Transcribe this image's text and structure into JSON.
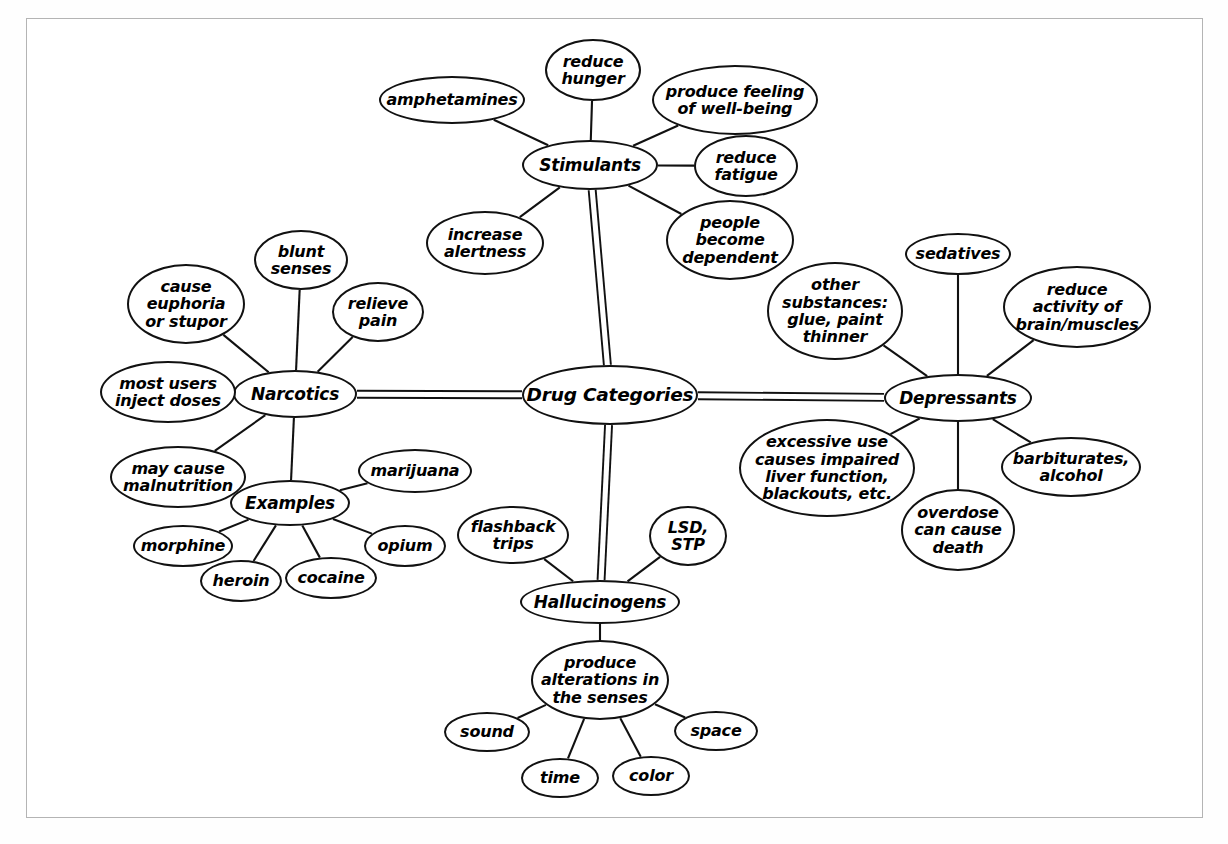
{
  "diagram": {
    "title": "Drug Categories",
    "type": "mind-map",
    "frame": {
      "stroke": "#b4b4b4",
      "background": "#ffffff"
    },
    "style": {
      "node_stroke": "#111111",
      "node_fill": "#ffffff",
      "text_color": "#000000",
      "edge_stroke": "#111111"
    },
    "nodes": [
      {
        "id": "drug-categories",
        "label": "Drug Categories",
        "kind": "center",
        "x": 610,
        "y": 395,
        "w": 176,
        "h": 60
      },
      {
        "id": "stimulants",
        "label": "Stimulants",
        "kind": "branch",
        "x": 590,
        "y": 165,
        "w": 136,
        "h": 50
      },
      {
        "id": "amphetamines",
        "label": "amphetamines",
        "kind": "leaf",
        "x": 452,
        "y": 100,
        "w": 146,
        "h": 48
      },
      {
        "id": "reduce-hunger",
        "label": "reduce\nhunger",
        "kind": "leaf",
        "x": 593,
        "y": 70,
        "w": 96,
        "h": 62
      },
      {
        "id": "produce-feeling-well-being",
        "label": "produce feeling\nof well-being",
        "kind": "leaf",
        "x": 735,
        "y": 100,
        "w": 166,
        "h": 70
      },
      {
        "id": "reduce-fatigue",
        "label": "reduce\nfatigue",
        "kind": "leaf",
        "x": 746,
        "y": 166,
        "w": 104,
        "h": 62
      },
      {
        "id": "people-become-dependent",
        "label": "people\nbecome\ndependent",
        "kind": "leaf",
        "x": 730,
        "y": 240,
        "w": 128,
        "h": 80
      },
      {
        "id": "increase-alertness",
        "label": "increase\nalertness",
        "kind": "leaf",
        "x": 485,
        "y": 243,
        "w": 118,
        "h": 64
      },
      {
        "id": "narcotics",
        "label": "Narcotics",
        "kind": "branch",
        "x": 295,
        "y": 394,
        "w": 124,
        "h": 48
      },
      {
        "id": "blunt-senses",
        "label": "blunt\nsenses",
        "kind": "leaf",
        "x": 301,
        "y": 260,
        "w": 94,
        "h": 60
      },
      {
        "id": "cause-euphoria-or-stupor",
        "label": "cause\neuphoria\nor stupor",
        "kind": "leaf",
        "x": 186,
        "y": 304,
        "w": 118,
        "h": 80
      },
      {
        "id": "relieve-pain",
        "label": "relieve\npain",
        "kind": "leaf",
        "x": 378,
        "y": 312,
        "w": 92,
        "h": 60
      },
      {
        "id": "most-users-inject-doses",
        "label": "most users\ninject doses",
        "kind": "leaf",
        "x": 168,
        "y": 392,
        "w": 136,
        "h": 62
      },
      {
        "id": "may-cause-malnutrition",
        "label": "may cause\nmalnutrition",
        "kind": "leaf",
        "x": 178,
        "y": 477,
        "w": 136,
        "h": 62
      },
      {
        "id": "examples",
        "label": "Examples",
        "kind": "branch",
        "x": 290,
        "y": 503,
        "w": 120,
        "h": 46
      },
      {
        "id": "marijuana",
        "label": "marijuana",
        "kind": "leaf",
        "x": 415,
        "y": 471,
        "w": 114,
        "h": 44
      },
      {
        "id": "opium",
        "label": "opium",
        "kind": "leaf",
        "x": 405,
        "y": 546,
        "w": 82,
        "h": 42
      },
      {
        "id": "cocaine",
        "label": "cocaine",
        "kind": "leaf",
        "x": 331,
        "y": 578,
        "w": 92,
        "h": 42
      },
      {
        "id": "heroin",
        "label": "heroin",
        "kind": "leaf",
        "x": 241,
        "y": 581,
        "w": 82,
        "h": 42
      },
      {
        "id": "morphine",
        "label": "morphine",
        "kind": "leaf",
        "x": 183,
        "y": 546,
        "w": 100,
        "h": 42
      },
      {
        "id": "depressants",
        "label": "Depressants",
        "kind": "branch",
        "x": 958,
        "y": 398,
        "w": 148,
        "h": 48
      },
      {
        "id": "sedatives",
        "label": "sedatives",
        "kind": "leaf",
        "x": 958,
        "y": 254,
        "w": 106,
        "h": 42
      },
      {
        "id": "other-substances",
        "label": "other\nsubstances:\nglue, paint\nthinner",
        "kind": "leaf",
        "x": 835,
        "y": 311,
        "w": 136,
        "h": 98
      },
      {
        "id": "reduce-activity",
        "label": "reduce\nactivity of\nbrain/muscles",
        "kind": "leaf",
        "x": 1077,
        "y": 307,
        "w": 148,
        "h": 82
      },
      {
        "id": "excessive-use",
        "label": "excessive use\ncauses impaired\nliver function,\nblackouts, etc.",
        "kind": "leaf",
        "x": 827,
        "y": 468,
        "w": 176,
        "h": 98
      },
      {
        "id": "barbiturates-alcohol",
        "label": "barbiturates,\nalcohol",
        "kind": "leaf",
        "x": 1071,
        "y": 467,
        "w": 140,
        "h": 60
      },
      {
        "id": "overdose-can-cause-death",
        "label": "overdose\ncan cause\ndeath",
        "kind": "leaf",
        "x": 958,
        "y": 530,
        "w": 114,
        "h": 82
      },
      {
        "id": "hallucinogens",
        "label": "Hallucinogens",
        "kind": "branch",
        "x": 600,
        "y": 602,
        "w": 160,
        "h": 44
      },
      {
        "id": "flashback-trips",
        "label": "flashback\ntrips",
        "kind": "leaf",
        "x": 513,
        "y": 535,
        "w": 112,
        "h": 58
      },
      {
        "id": "lsd-stp",
        "label": "LSD,\nSTP",
        "kind": "leaf",
        "x": 688,
        "y": 536,
        "w": 78,
        "h": 60
      },
      {
        "id": "produce-alterations",
        "label": "produce\nalterations in\nthe senses",
        "kind": "leaf",
        "x": 600,
        "y": 680,
        "w": 138,
        "h": 80
      },
      {
        "id": "sound",
        "label": "sound",
        "kind": "leaf",
        "x": 487,
        "y": 732,
        "w": 86,
        "h": 40
      },
      {
        "id": "space",
        "label": "space",
        "kind": "leaf",
        "x": 716,
        "y": 731,
        "w": 84,
        "h": 40
      },
      {
        "id": "time",
        "label": "time",
        "kind": "leaf",
        "x": 560,
        "y": 778,
        "w": 78,
        "h": 40
      },
      {
        "id": "color",
        "label": "color",
        "kind": "leaf",
        "x": 651,
        "y": 776,
        "w": 78,
        "h": 40
      }
    ],
    "edges": [
      {
        "from": "drug-categories",
        "to": "stimulants",
        "style": "double"
      },
      {
        "from": "drug-categories",
        "to": "narcotics",
        "style": "double"
      },
      {
        "from": "drug-categories",
        "to": "depressants",
        "style": "double"
      },
      {
        "from": "drug-categories",
        "to": "hallucinogens",
        "style": "double"
      },
      {
        "from": "stimulants",
        "to": "amphetamines",
        "style": "single"
      },
      {
        "from": "stimulants",
        "to": "reduce-hunger",
        "style": "single"
      },
      {
        "from": "stimulants",
        "to": "produce-feeling-well-being",
        "style": "single"
      },
      {
        "from": "stimulants",
        "to": "reduce-fatigue",
        "style": "single"
      },
      {
        "from": "stimulants",
        "to": "people-become-dependent",
        "style": "single"
      },
      {
        "from": "stimulants",
        "to": "increase-alertness",
        "style": "single"
      },
      {
        "from": "narcotics",
        "to": "blunt-senses",
        "style": "single"
      },
      {
        "from": "narcotics",
        "to": "cause-euphoria-or-stupor",
        "style": "single"
      },
      {
        "from": "narcotics",
        "to": "relieve-pain",
        "style": "single"
      },
      {
        "from": "narcotics",
        "to": "most-users-inject-doses",
        "style": "single"
      },
      {
        "from": "narcotics",
        "to": "may-cause-malnutrition",
        "style": "single"
      },
      {
        "from": "narcotics",
        "to": "examples",
        "style": "single"
      },
      {
        "from": "examples",
        "to": "marijuana",
        "style": "single"
      },
      {
        "from": "examples",
        "to": "opium",
        "style": "single"
      },
      {
        "from": "examples",
        "to": "cocaine",
        "style": "single"
      },
      {
        "from": "examples",
        "to": "heroin",
        "style": "single"
      },
      {
        "from": "examples",
        "to": "morphine",
        "style": "single"
      },
      {
        "from": "depressants",
        "to": "sedatives",
        "style": "single"
      },
      {
        "from": "depressants",
        "to": "other-substances",
        "style": "single"
      },
      {
        "from": "depressants",
        "to": "reduce-activity",
        "style": "single"
      },
      {
        "from": "depressants",
        "to": "excessive-use",
        "style": "single"
      },
      {
        "from": "depressants",
        "to": "barbiturates-alcohol",
        "style": "single"
      },
      {
        "from": "depressants",
        "to": "overdose-can-cause-death",
        "style": "single"
      },
      {
        "from": "hallucinogens",
        "to": "flashback-trips",
        "style": "single"
      },
      {
        "from": "hallucinogens",
        "to": "lsd-stp",
        "style": "single"
      },
      {
        "from": "hallucinogens",
        "to": "produce-alterations",
        "style": "single"
      },
      {
        "from": "produce-alterations",
        "to": "sound",
        "style": "single"
      },
      {
        "from": "produce-alterations",
        "to": "space",
        "style": "single"
      },
      {
        "from": "produce-alterations",
        "to": "time",
        "style": "single"
      },
      {
        "from": "produce-alterations",
        "to": "color",
        "style": "single"
      }
    ]
  }
}
